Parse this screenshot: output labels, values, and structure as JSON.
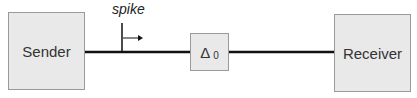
{
  "diagram": {
    "nodes": {
      "sender": {
        "label": "Sender"
      },
      "delay": {
        "label": "Δ",
        "subscript": "0"
      },
      "receiver": {
        "label": "Receiver"
      }
    },
    "spike": {
      "label": "spike"
    },
    "colors": {
      "box_fill": "#e9e9e9",
      "box_border": "#9a9a9a",
      "wire": "#111111"
    }
  }
}
